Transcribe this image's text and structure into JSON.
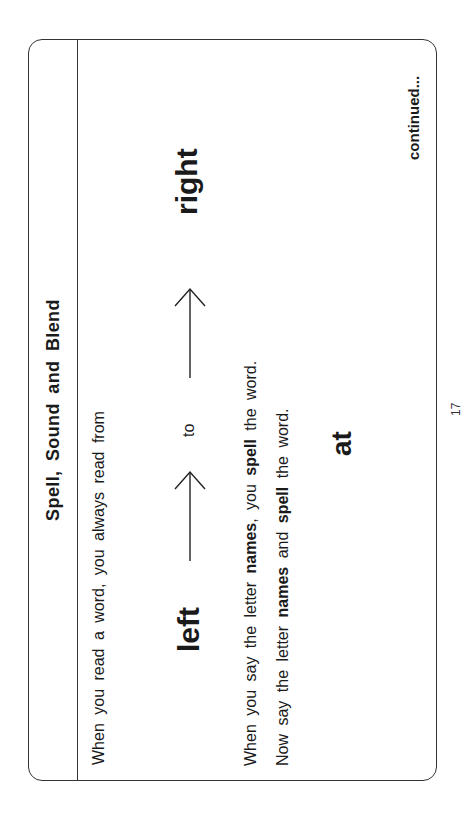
{
  "page": {
    "title": "Spell, Sound and Blend",
    "intro_line": "When you read a word, you always read from",
    "direction": {
      "left_word": "left",
      "connector": "to",
      "right_word": "right",
      "arrow_icon": "right-arrow"
    },
    "line1": {
      "part1": "When you say the letter ",
      "bold1": "names",
      "part2": ", you ",
      "bold2": "spell",
      "part3": " the word."
    },
    "line2": {
      "part1": "Now say the letter ",
      "bold1": "names",
      "part2": " and ",
      "bold2": "spell",
      "part3": " the word."
    },
    "example_word": "at",
    "continued_label": "continued...",
    "page_number": "17"
  }
}
